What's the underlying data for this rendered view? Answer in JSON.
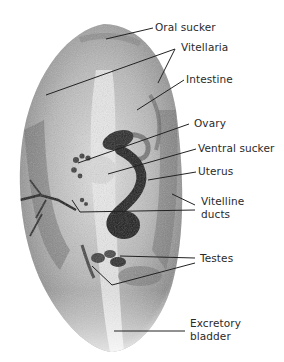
{
  "figure": {
    "colors": {
      "background": "#ffffff",
      "body_fill": "#cfcfcf",
      "body_dark": "#3a3a3a",
      "leader": "#222222",
      "text": "#2a2a2a"
    }
  },
  "labels": [
    {
      "id": "oral-sucker",
      "text": "Oral sucker"
    },
    {
      "id": "vitellaria",
      "text": "Vitellaria"
    },
    {
      "id": "intestine",
      "text": "Intestine"
    },
    {
      "id": "ovary",
      "text": "Ovary"
    },
    {
      "id": "ventral-sucker",
      "text": "Ventral sucker"
    },
    {
      "id": "uterus",
      "text": "Uterus"
    },
    {
      "id": "vitelline-ducts-1",
      "text": "Vitelline"
    },
    {
      "id": "vitelline-ducts-2",
      "text": "ducts"
    },
    {
      "id": "testes",
      "text": "Testes"
    },
    {
      "id": "excretory-bladder-1",
      "text": "Excretory"
    },
    {
      "id": "excretory-bladder-2",
      "text": "bladder"
    }
  ]
}
